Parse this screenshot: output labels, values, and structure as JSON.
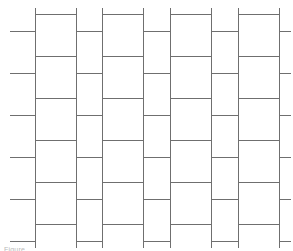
{
  "figure": {
    "name": "tiling-pattern-diagram",
    "title": "Rectangular staggered tiling pattern",
    "caption_text": "Figure",
    "background_color": "#ffffff",
    "line_color": "#6f6f6f",
    "line_width_px": 1,
    "canvas": {
      "width": 293,
      "height": 251
    }
  },
  "geometry": {
    "vertical_lines_x": [
      35,
      76,
      102,
      143,
      170,
      211,
      238,
      279
    ],
    "vertical_line_top_y": 8,
    "vertical_line_bottom_y": 248,
    "wide_column_joint_y": [
      14,
      56,
      98,
      140,
      182,
      224
    ],
    "narrow_column_joint_y": [
      31,
      73,
      115,
      157,
      199,
      241
    ],
    "left_stub_x_start": 10,
    "right_stub_x_end": 291,
    "column_widths": [
      41,
      26,
      41,
      27,
      41,
      27,
      41
    ],
    "column_phases": [
      "wide",
      "narrow",
      "wide",
      "narrow",
      "wide",
      "narrow",
      "wide"
    ],
    "row_pitch": 42,
    "phase_offset": 17
  },
  "elements": {
    "vertical_rule_label": "vertical grout line",
    "horizontal_rule_label": "horizontal grout line",
    "stub_label": "edge joint stub"
  }
}
